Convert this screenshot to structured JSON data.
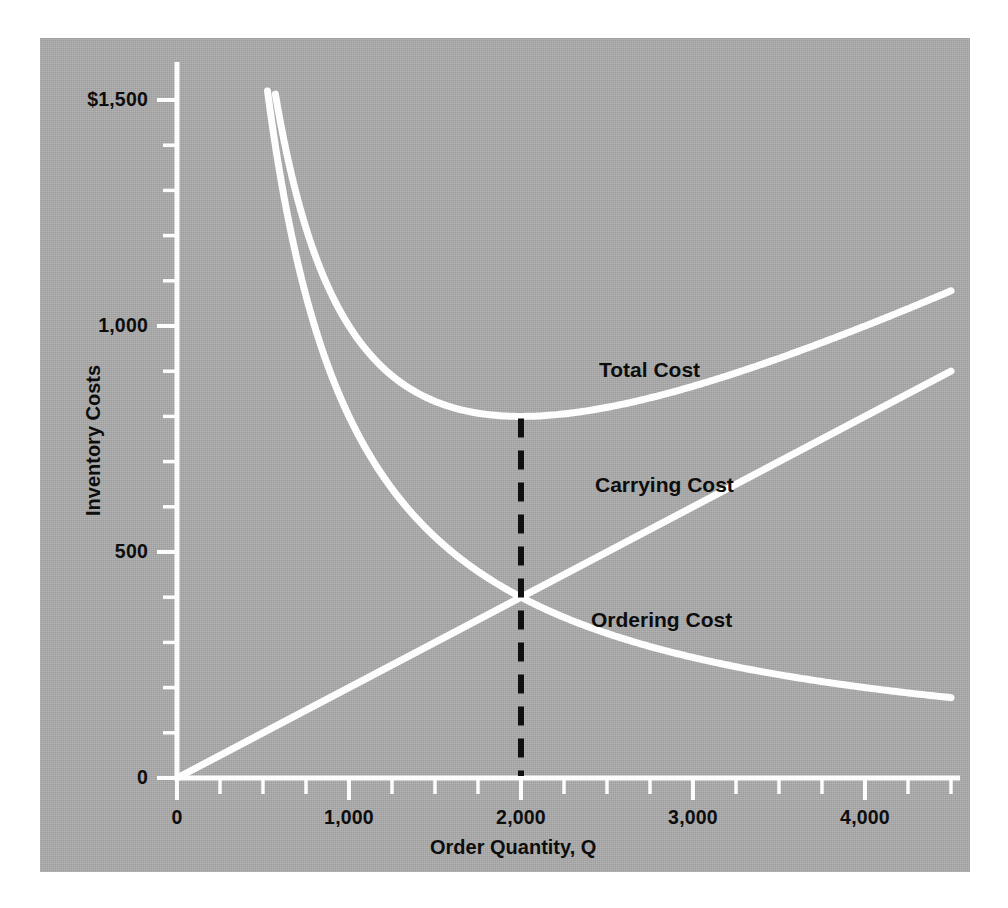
{
  "chart_data": {
    "type": "line",
    "title": "",
    "xlabel": "Order Quantity, Q",
    "ylabel": "Inventory Costs",
    "xlim": [
      0,
      4500
    ],
    "ylim": [
      0,
      1600
    ],
    "grid": false,
    "legend_position": "inline-annotations",
    "x_ticks_major": [
      0,
      1000,
      2000,
      3000,
      4000
    ],
    "x_tick_labels": [
      "0",
      "1,000",
      "2,000",
      "3,000",
      "4,000"
    ],
    "x_tick_minor_step": 250,
    "y_ticks_major": [
      0,
      500,
      1000,
      1500
    ],
    "y_tick_labels": [
      "0",
      "500",
      "1,000",
      "$1,500"
    ],
    "y_tick_minor_step": 100,
    "annotations": [
      {
        "text": "Total Cost",
        "x": 2700,
        "y": 880
      },
      {
        "text": "Carrying Cost",
        "x": 2700,
        "y": 625
      },
      {
        "text": "Ordering Cost",
        "x": 2690,
        "y": 330
      }
    ],
    "eoq_marker": {
      "label": "",
      "x": 2000,
      "y_top": 780,
      "y_bottom": 0,
      "style": "dashed-vertical",
      "color": "#101010"
    },
    "series": [
      {
        "name": "Ordering Cost",
        "color": "#fdfdfd",
        "formula": "1,560,000 / Q",
        "x": [
          525,
          600,
          700,
          800,
          900,
          1000,
          1100,
          1200,
          1300,
          1400,
          1500,
          1600,
          1700,
          1800,
          1900,
          2000,
          2100,
          2200,
          2400,
          2600,
          2800,
          3000,
          3200,
          3400,
          3600,
          3800,
          4000,
          4200,
          4400,
          4500
        ],
        "y": [
          1513,
          1320,
          1131,
          990,
          880,
          792,
          720,
          660,
          609,
          566,
          528,
          495,
          466,
          440,
          417,
          396,
          377,
          360,
          330,
          304,
          283,
          264,
          248,
          233,
          220,
          208,
          198,
          189,
          180,
          176
        ]
      },
      {
        "name": "Carrying Cost",
        "color": "#fdfdfd",
        "formula": "0.198 * Q",
        "x": [
          0,
          500,
          1000,
          1500,
          2000,
          2500,
          3000,
          3500,
          4000,
          4500
        ],
        "y": [
          0,
          99,
          198,
          297,
          396,
          495,
          594,
          693,
          792,
          891
        ]
      },
      {
        "name": "Total Cost",
        "color": "#fdfdfd",
        "formula": "1,560,000 / Q + 0.198 * Q",
        "x": [
          570,
          650,
          750,
          850,
          950,
          1050,
          1150,
          1250,
          1400,
          1550,
          1700,
          1850,
          2000,
          2150,
          2300,
          2500,
          2700,
          2900,
          3100,
          3300,
          3500,
          3700,
          3900,
          4100,
          4300,
          4500
        ],
        "y": [
          1510,
          1529,
          1229,
          1104,
          1030,
          1094,
          1084,
          1095,
          1116,
          1113,
          1130,
          1172,
          1188,
          1204,
          1234,
          1276,
          1312,
          1356,
          1406,
          1457,
          1511,
          1565,
          1622,
          1680,
          1739,
          1799
        ]
      }
    ]
  },
  "axes": {
    "y_title": "Inventory Costs",
    "x_title": "Order Quantity, Q",
    "y_labels": [
      {
        "value": 1500,
        "text": "$1,500"
      },
      {
        "value": 1000,
        "text": "1,000"
      },
      {
        "value": 500,
        "text": "500"
      },
      {
        "value": 0,
        "text": "0"
      }
    ],
    "x_labels": [
      {
        "value": 0,
        "text": "0"
      },
      {
        "value": 1000,
        "text": "1,000"
      },
      {
        "value": 2000,
        "text": "2,000"
      },
      {
        "value": 3000,
        "text": "3,000"
      },
      {
        "value": 4000,
        "text": "4,000"
      }
    ]
  },
  "curve_labels": {
    "total": "Total Cost",
    "carrying": "Carrying Cost",
    "ordering": "Ordering Cost"
  },
  "colors": {
    "panel_background": "#ababab",
    "curve_stroke": "#fdfdfd",
    "axis_stroke": "#fdfdfd",
    "text": "#0d0d0d",
    "eoq_line": "#101010",
    "page_background": "#ffffff"
  }
}
